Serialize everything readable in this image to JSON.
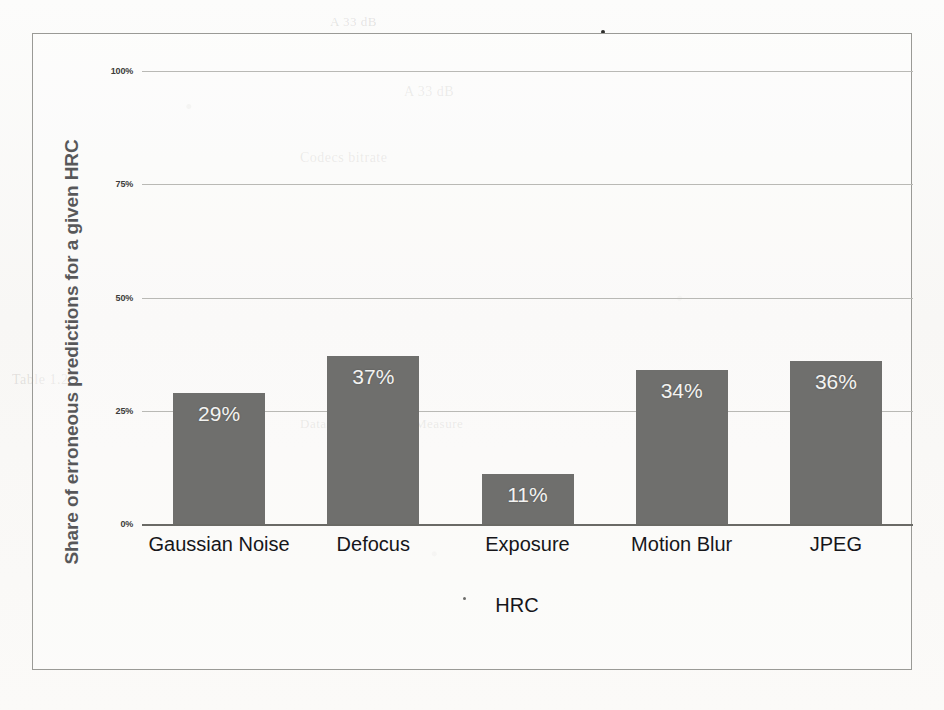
{
  "chart_data": {
    "type": "bar",
    "title": "",
    "xlabel": "HRC",
    "ylabel": "Share of erroneous predictions for a given HRC",
    "categories": [
      "Gaussian Noise",
      "Defocus",
      "Exposure",
      "Motion Blur",
      "JPEG"
    ],
    "values": [
      29,
      37,
      11,
      34,
      36
    ],
    "value_labels": [
      "29%",
      "37%",
      "11%",
      "34%",
      "36%"
    ],
    "ylim": [
      0,
      100
    ],
    "yticks": [
      0,
      25,
      50,
      75,
      100
    ],
    "ytick_labels": [
      "0%",
      "25%",
      "50%",
      "75%",
      "100%"
    ],
    "grid": true,
    "legend": "none",
    "bar_color": "#6f6f6d",
    "value_label_color": "#f3f3f1",
    "gridline_color": "#b9b9b5",
    "axis_color": "#6a6a66"
  },
  "axes": {
    "y_title": "Share of erroneous predictions for a given HRC",
    "x_title": "HRC"
  },
  "ticks": {
    "y": [
      {
        "label": "100%",
        "value": 100
      },
      {
        "label": "75%",
        "value": 75
      },
      {
        "label": "50%",
        "value": 50
      },
      {
        "label": "25%",
        "value": 25
      },
      {
        "label": "0%",
        "value": 0
      }
    ]
  },
  "bars": [
    {
      "category": "Gaussian Noise",
      "value": 29,
      "label": "29%"
    },
    {
      "category": "Defocus",
      "value": 37,
      "label": "37%"
    },
    {
      "category": "Exposure",
      "value": 11,
      "label": "11%"
    },
    {
      "category": "Motion Blur",
      "value": 34,
      "label": "34%"
    },
    {
      "category": "JPEG",
      "value": 36,
      "label": "36%"
    }
  ],
  "background_text": {
    "line1": "A 33 dB",
    "line2": "Codecs bitrate",
    "line3": "Table 1.2",
    "line4": "Dataset / Reference Measure"
  }
}
